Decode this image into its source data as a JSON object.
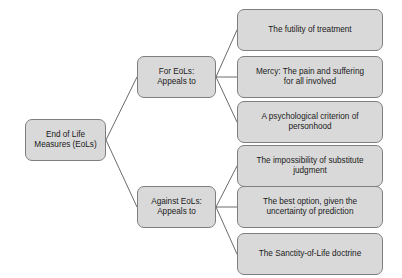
{
  "diagram": {
    "title": "End of Life Measures (EoLs)",
    "colors": {
      "node_fill": "#d9d9d9",
      "node_border": "#7f7f7f",
      "connector": "#595959",
      "text": "#1a1a1a",
      "background": "#ffffff"
    },
    "root": {
      "label": "End of Life\nMeasures (EoLs)"
    },
    "branches": [
      {
        "label": "For EoLs:\nAppeals to",
        "leaves": [
          {
            "label": "The futility of treatment"
          },
          {
            "label": "Mercy: The pain and suffering\nfor all involved"
          },
          {
            "label": "A psychological criterion of\npersonhood"
          }
        ]
      },
      {
        "label": "Against EoLs:\nAppeals to",
        "leaves": [
          {
            "label": "The impossibility of substitute\njudgment"
          },
          {
            "label": "The best option, given the\nuncertainty of prediction"
          },
          {
            "label": "The Sanctity-of-Life doctrine"
          }
        ]
      }
    ]
  }
}
